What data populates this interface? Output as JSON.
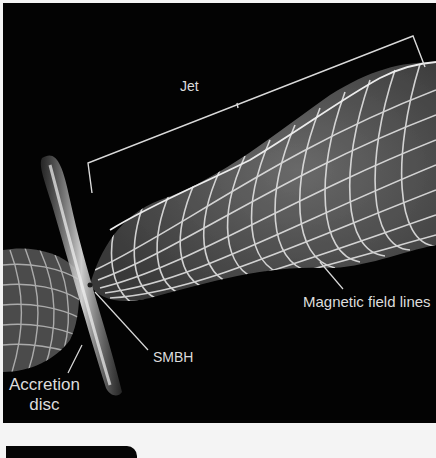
{
  "figure": {
    "title": "",
    "background_color": "#030303",
    "line_color": "#e6e6e6",
    "labels": {
      "jet": "Jet",
      "magnetic_field_lines": "Magnetic field lines",
      "smbh": "SMBH",
      "accretion_disc_line1": "Accretion",
      "accretion_disc_line2": "disc"
    },
    "components": [
      "Jet (helical magnetic field wireframe)",
      "Counter-jet lobe",
      "Accretion disc",
      "SMBH",
      "Jet extent bracket"
    ]
  }
}
